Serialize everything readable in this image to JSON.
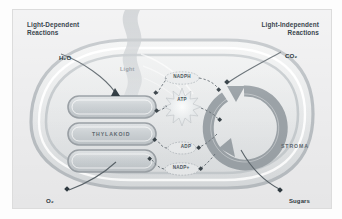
{
  "diagram": {
    "headings": {
      "left": "Light-Dependent\nReactions",
      "right": "Light-Independent\nReactions"
    },
    "structures": {
      "thylakoid": "THYLAKOID",
      "stroma": "STROMA"
    },
    "inputs": {
      "water": "H₂O",
      "light": "Light",
      "carbon_dioxide": "CO₂"
    },
    "outputs": {
      "oxygen": "O₂",
      "sugars": "Sugars"
    },
    "carriers": {
      "nadph": "NADPH",
      "atp": "ATP",
      "adp": "ADP",
      "nadp_plus": "NADP+"
    },
    "colors": {
      "background": "#ececed",
      "outer_membrane": "#c9cdd0",
      "inner_membrane": "#d6dadc",
      "thylakoid_fill": "#d2d6d9",
      "thylakoid_stroke": "#a8aeb3",
      "cycle_arrow": "#9aa1a6",
      "light_beam": "#c2c6c9",
      "label_text": "#3d4a52",
      "connector_line": "#6e767c",
      "starburst": "#e4e7e9"
    }
  }
}
